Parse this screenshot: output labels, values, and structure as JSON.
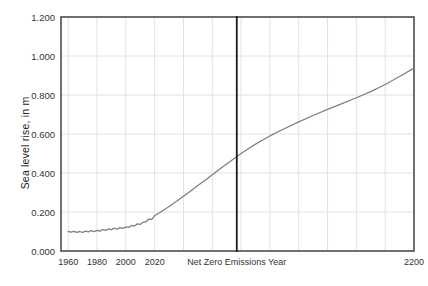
{
  "chart_data": {
    "type": "line",
    "title": "",
    "xlabel": "Net Zero Emissions Year",
    "ylabel": "Sea level rise, in m",
    "xlim": [
      1955,
      2200
    ],
    "ylim": [
      0.0,
      1.2
    ],
    "grid": true,
    "legend": null,
    "y_ticks": [
      "0.000",
      "0.200",
      "0.400",
      "0.600",
      "0.800",
      "1.000",
      "1.200"
    ],
    "y_tick_values": [
      0.0,
      0.2,
      0.4,
      0.6,
      0.8,
      1.0,
      1.2
    ],
    "x_ticks": [
      "1960",
      "1980",
      "2000",
      "2020",
      "2200"
    ],
    "x_tick_values": [
      1960,
      1980,
      2000,
      2020,
      2200
    ],
    "annotations": [
      {
        "name": "net-zero-emissions-year-line",
        "type": "vline",
        "x": 2077,
        "label": "Net Zero Emissions Year",
        "color": "#1a1a1a"
      }
    ],
    "series": [
      {
        "name": "sea-level-rise",
        "color": "#808080",
        "x": [
          1960,
          1962,
          1964,
          1966,
          1968,
          1970,
          1972,
          1974,
          1976,
          1978,
          1980,
          1982,
          1984,
          1986,
          1988,
          1990,
          1992,
          1994,
          1996,
          1998,
          2000,
          2002,
          2004,
          2006,
          2008,
          2010,
          2012,
          2014,
          2016,
          2018,
          2020,
          2025,
          2030,
          2035,
          2040,
          2045,
          2050,
          2055,
          2060,
          2065,
          2070,
          2075,
          2080,
          2085,
          2090,
          2095,
          2100,
          2110,
          2120,
          2130,
          2140,
          2150,
          2160,
          2170,
          2180,
          2190,
          2200
        ],
        "y": [
          0.1,
          0.097,
          0.101,
          0.096,
          0.1,
          0.095,
          0.102,
          0.098,
          0.104,
          0.099,
          0.106,
          0.102,
          0.11,
          0.106,
          0.113,
          0.11,
          0.117,
          0.112,
          0.12,
          0.116,
          0.124,
          0.121,
          0.131,
          0.128,
          0.139,
          0.136,
          0.148,
          0.15,
          0.164,
          0.162,
          0.181,
          0.204,
          0.228,
          0.254,
          0.281,
          0.308,
          0.336,
          0.363,
          0.391,
          0.419,
          0.446,
          0.473,
          0.5,
          0.524,
          0.548,
          0.569,
          0.59,
          0.627,
          0.662,
          0.695,
          0.726,
          0.756,
          0.786,
          0.817,
          0.854,
          0.895,
          0.938
        ]
      }
    ]
  },
  "axes": {
    "frame_color": "#4d4d4d",
    "grid_color": "#e2e2e2",
    "background": "#ffffff"
  }
}
